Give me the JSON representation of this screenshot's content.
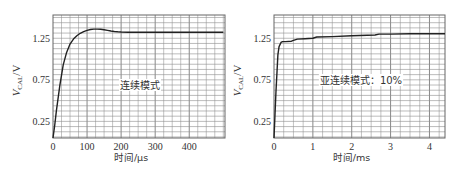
{
  "chart_data": [
    {
      "type": "line",
      "name": "continuous-mode",
      "title": "",
      "annotation": "连续模式",
      "xlabel": "时间/μs",
      "ylabel_main": "V",
      "ylabel_sub": "CAL",
      "ylabel_unit": "/V",
      "xlim": [
        0,
        505
      ],
      "ylim": [
        0.05,
        1.53
      ],
      "xticks": [
        0,
        100,
        200,
        300,
        400
      ],
      "xtick_labels": [
        "0",
        "100",
        "200",
        "300",
        "400"
      ],
      "yticks": [
        0.25,
        0.75,
        1.25
      ],
      "ytick_labels": [
        "0.25",
        "0.75",
        "1.25"
      ],
      "x_grid_step": 25,
      "y_grid_step": 0.0625,
      "grid": true,
      "series": [
        {
          "name": "V_CAL",
          "x": [
            0,
            5,
            10,
            20,
            30,
            40,
            50,
            60,
            70,
            80,
            90,
            100,
            110,
            120,
            130,
            140,
            150,
            160,
            170,
            180,
            190,
            200,
            220,
            250,
            300,
            350,
            400,
            450,
            500
          ],
          "y": [
            0.05,
            0.2,
            0.38,
            0.68,
            0.93,
            1.08,
            1.18,
            1.24,
            1.28,
            1.31,
            1.33,
            1.345,
            1.355,
            1.36,
            1.36,
            1.358,
            1.352,
            1.345,
            1.338,
            1.332,
            1.328,
            1.325,
            1.322,
            1.322,
            1.322,
            1.322,
            1.322,
            1.322,
            1.322
          ]
        }
      ]
    },
    {
      "type": "line",
      "name": "sub-continuous-mode",
      "title": "",
      "annotation": "亚连续模式：10%",
      "xlabel": "时间/ms",
      "ylabel_main": "V",
      "ylabel_sub": "CAL",
      "ylabel_unit": "/V",
      "xlim": [
        0,
        4.4
      ],
      "ylim": [
        0.05,
        1.53
      ],
      "xticks": [
        0,
        1,
        2,
        3,
        4
      ],
      "xtick_labels": [
        "0",
        "1",
        "2",
        "3",
        "4"
      ],
      "yticks": [
        0.25,
        0.75,
        1.25
      ],
      "ytick_labels": [
        "0.25",
        "0.75",
        "1.25"
      ],
      "x_grid_step": 0.25,
      "y_grid_step": 0.0625,
      "grid": true,
      "series": [
        {
          "name": "V_CAL",
          "x": [
            0,
            0.05,
            0.1,
            0.13,
            0.18,
            0.22,
            0.3,
            0.45,
            0.5,
            0.6,
            0.8,
            1.0,
            1.1,
            1.5,
            2.0,
            2.6,
            2.7,
            3.0,
            3.5,
            4.0,
            4.4
          ],
          "y": [
            0.05,
            0.6,
            1.05,
            1.15,
            1.2,
            1.21,
            1.21,
            1.215,
            1.225,
            1.24,
            1.245,
            1.25,
            1.265,
            1.27,
            1.28,
            1.29,
            1.3,
            1.3,
            1.305,
            1.305,
            1.305
          ]
        }
      ]
    }
  ]
}
